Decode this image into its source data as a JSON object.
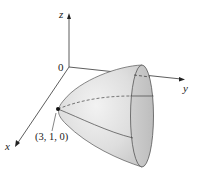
{
  "figure": {
    "type": "3d-surface-diagram",
    "axes": {
      "x_label": "x",
      "y_label": "y",
      "z_label": "z",
      "origin_label": "0"
    },
    "point": {
      "label": "(3, 1, 0)"
    },
    "colors": {
      "surface_fill": "#d9d9d9",
      "surface_light": "#ececec",
      "rim_fill": "#c4c4c4",
      "line": "#333333",
      "axis": "#333333"
    }
  }
}
